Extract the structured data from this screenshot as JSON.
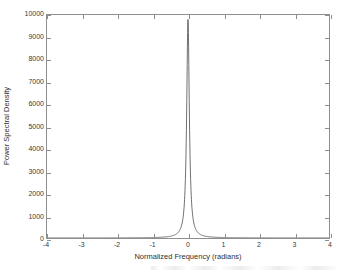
{
  "chart_data": {
    "type": "line",
    "title": "",
    "xlabel": "Normalized Frequency (radians)",
    "ylabel": "Power Spectral Density",
    "xlim": [
      -4,
      4
    ],
    "ylim": [
      0,
      10000
    ],
    "xticks": [
      "-4",
      "-3",
      "-2",
      "-1",
      "0",
      "1",
      "2",
      "3",
      "4"
    ],
    "xtick_values": [
      -4,
      -3,
      -2,
      -1,
      0,
      1,
      2,
      3,
      4
    ],
    "yticks": [
      "0",
      "1000",
      "2000",
      "3000",
      "4000",
      "5000",
      "6000",
      "7000",
      "8000",
      "9000",
      "10000"
    ],
    "ytick_values": [
      0,
      1000,
      2000,
      3000,
      4000,
      5000,
      6000,
      7000,
      8000,
      9000,
      10000
    ],
    "grid": false,
    "legend": null,
    "line_color": "#4d4d4d",
    "peak": {
      "center": 0,
      "height": 9800,
      "half_width": 0.045
    },
    "series": [
      {
        "name": "Power Spectral Density",
        "x": [
          -4.0,
          -3.6,
          -3.2,
          -2.8,
          -2.4,
          -2.0,
          -1.6,
          -1.2,
          -0.9,
          -0.7,
          -0.5,
          -0.4,
          -0.3,
          -0.25,
          -0.2,
          -0.16,
          -0.13,
          -0.1,
          -0.08,
          -0.06,
          -0.05,
          -0.04,
          -0.03,
          -0.02,
          -0.01,
          0.0,
          0.01,
          0.02,
          0.03,
          0.04,
          0.05,
          0.06,
          0.08,
          0.1,
          0.13,
          0.16,
          0.2,
          0.25,
          0.3,
          0.4,
          0.5,
          0.7,
          0.9,
          1.2,
          1.6,
          2.0,
          2.4,
          2.8,
          3.2,
          3.6,
          4.0
        ],
        "y": [
          1,
          1,
          2,
          2,
          3,
          4,
          6,
          11,
          20,
          33,
          65,
          101,
          179,
          258,
          402,
          628,
          952,
          1593,
          2440,
          4100,
          5500,
          7100,
          8500,
          9400,
          9750,
          9800,
          9750,
          9400,
          8500,
          7100,
          5500,
          4100,
          2440,
          1593,
          952,
          628,
          402,
          258,
          179,
          101,
          65,
          33,
          20,
          11,
          6,
          4,
          3,
          2,
          2,
          1,
          1
        ]
      }
    ]
  }
}
